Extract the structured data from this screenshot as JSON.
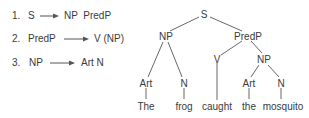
{
  "rules": [
    {
      "num": "1.",
      "lhs": "S",
      "rhs": "NP  PredP"
    },
    {
      "num": "2.",
      "lhs": "PredP",
      "rhs": "V (NP)"
    },
    {
      "num": "3.",
      "lhs": "NP",
      "rhs": "Art N"
    }
  ],
  "tree": {
    "nodes": {
      "s": "S",
      "np1": "NP",
      "predp": "PredP",
      "v": "V",
      "np2": "NP",
      "art1": "Art",
      "n1": "N",
      "art2": "Art",
      "n2": "N"
    },
    "words": {
      "w1": "The",
      "w2": "frog",
      "w3": "caught",
      "w4": "the",
      "w5": "mosquito"
    }
  },
  "colors": {
    "text": "#3a3a3a",
    "line": "#555555"
  }
}
